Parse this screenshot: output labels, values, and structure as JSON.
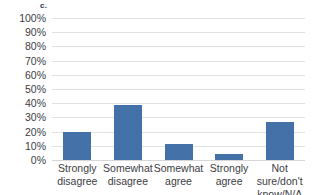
{
  "panel": {
    "label": "c."
  },
  "chart_data": {
    "type": "bar",
    "title": "",
    "subtitle": "",
    "xlabel": "",
    "ylabel": "",
    "categories": [
      "Strongly disagree",
      "Somewhat disagree",
      "Somewhat agree",
      "Strongly agree",
      "Not sure/don't know/N/A"
    ],
    "category_lines": [
      [
        "Strongly",
        "disagree"
      ],
      [
        "Somewhat",
        "disagree"
      ],
      [
        "Somewhat",
        "agree"
      ],
      [
        "Strongly",
        "agree"
      ],
      [
        "Not sure/don't",
        "know/N/A"
      ]
    ],
    "values": [
      20,
      39,
      11,
      4,
      27
    ],
    "value_labels": [
      "20%",
      "39%",
      "11%",
      "4%",
      "27%"
    ],
    "ylim": [
      0,
      100
    ],
    "y_ticks": [
      100,
      90,
      80,
      70,
      60,
      50,
      40,
      30,
      20,
      10,
      0
    ],
    "y_tick_labels": [
      "100%",
      "90%",
      "80%",
      "70%",
      "60%",
      "50%",
      "40%",
      "30%",
      "20%",
      "10%",
      "0%"
    ],
    "grid": "horizontal",
    "legend": "none",
    "series": [
      {
        "name": "Responses",
        "values": [
          20,
          39,
          11,
          4,
          27
        ],
        "color": "#4472a8"
      }
    ],
    "colors": {
      "bar": "#4472a8",
      "gridline": "#e2e2e4",
      "background": "#ffffff",
      "text": "#3c3c44"
    }
  }
}
